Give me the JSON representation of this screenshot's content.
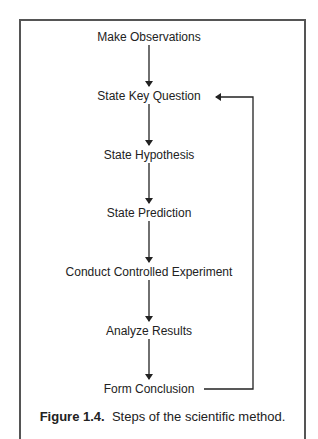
{
  "diagram": {
    "steps": [
      {
        "label": "Make Observations"
      },
      {
        "label": "State Key Question"
      },
      {
        "label": "State Hypothesis"
      },
      {
        "label": "State Prediction"
      },
      {
        "label": "Conduct Controlled Experiment"
      },
      {
        "label": "Analyze Results"
      },
      {
        "label": "Form Conclusion"
      }
    ],
    "feedback_loop": {
      "from": "Form Conclusion",
      "to": "State Key Question"
    }
  },
  "caption": {
    "figure_label": "Figure 1.4.",
    "text": "Steps of the scientific method."
  }
}
